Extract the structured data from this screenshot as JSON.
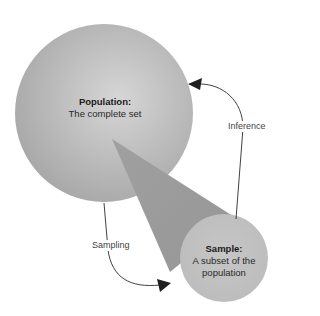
{
  "nodes": {
    "population": {
      "title": "Population:",
      "subtitle": "The complete set"
    },
    "sample": {
      "title": "Sample:",
      "subtitle_line1": "A subset of the",
      "subtitle_line2": "population"
    }
  },
  "edges": {
    "sampling": {
      "label": "Sampling"
    },
    "inference": {
      "label": "Inference"
    }
  },
  "colors": {
    "population_light": "#d4d4d4",
    "population_dark": "#a9a9a9",
    "cone": "#9d9d9d",
    "sample_fill": "#c2c2c2",
    "arrow": "#2b2b2b"
  }
}
